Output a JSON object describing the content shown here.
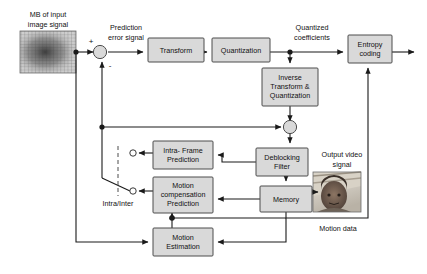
{
  "diagram": {
    "colors": {
      "block_fill": "#d9d9d9",
      "block_stroke": "#4c4c4c",
      "wire": "#1a1a1a",
      "background": "#ffffff"
    },
    "blocks": [
      {
        "id": "transform",
        "label": "Transform",
        "x": 148,
        "y": 38,
        "w": 56,
        "h": 24
      },
      {
        "id": "quantization",
        "label": "Quantization",
        "x": 212,
        "y": 38,
        "w": 58,
        "h": 24
      },
      {
        "id": "entropy_coding",
        "label_line1": "Entropy",
        "label_line2": "coding",
        "x": 348,
        "y": 35,
        "w": 44,
        "h": 28
      },
      {
        "id": "inverse_tq",
        "label_line1": "Inverse",
        "label_line2": "Transform &",
        "label_line3": "Quantization",
        "x": 262,
        "y": 68,
        "w": 56,
        "h": 38
      },
      {
        "id": "deblocking",
        "label_line1": "Deblocking",
        "label_line2": "Filter",
        "x": 256,
        "y": 148,
        "w": 52,
        "h": 28
      },
      {
        "id": "memory",
        "label": "Memory",
        "x": 260,
        "y": 186,
        "w": 52,
        "h": 26
      },
      {
        "id": "intra_frame",
        "label_line1": "Intra- Frame",
        "label_line2": "Prediction",
        "x": 153,
        "y": 141,
        "w": 60,
        "h": 28
      },
      {
        "id": "motion_comp",
        "label_line1": "Motion",
        "label_line2": "compensation",
        "label_line3": "Prediction",
        "x": 153,
        "y": 177,
        "w": 60,
        "h": 36
      },
      {
        "id": "motion_est",
        "label_line1": "Motion",
        "label_line2": "Estimation",
        "x": 153,
        "y": 228,
        "w": 60,
        "h": 28
      }
    ],
    "annotations": [
      {
        "id": "mb_input",
        "line1": "MB of input",
        "line2": "image signal",
        "x": 44,
        "y": 14
      },
      {
        "id": "pred_error",
        "line1": "Prediction",
        "line2": "error signal",
        "x": 124,
        "y": 27
      },
      {
        "id": "quant_coeff",
        "line1": "Quantized",
        "line2": "coefficients",
        "x": 310,
        "y": 27
      },
      {
        "id": "output_video",
        "line1": "Output video",
        "line2": "signal",
        "x": 353,
        "y": 152
      },
      {
        "id": "motion_data",
        "line1": "Motion data",
        "x": 385,
        "y": 229
      },
      {
        "id": "intra_inter",
        "line1": "Intra/Inter",
        "x": 119,
        "y": 203
      }
    ],
    "signs": [
      {
        "id": "plus_sign",
        "label": "+",
        "x": 91,
        "y": 43
      },
      {
        "id": "minus_sign",
        "label": "-",
        "x": 108,
        "y": 65
      }
    ],
    "thumbnails": [
      {
        "id": "input_macroblock_thumbnail",
        "x": 20,
        "y": 31,
        "w": 56,
        "h": 42
      },
      {
        "id": "output_video_thumbnail",
        "x": 313,
        "y": 172,
        "w": 48,
        "h": 40
      }
    ],
    "switch": {
      "id": "intra_inter_switch",
      "label": "Intra/Inter",
      "contact_intra": {
        "x": 133,
        "y": 153
      },
      "contact_inter": {
        "x": 133,
        "y": 191
      },
      "pivot": {
        "x": 102,
        "y": 178
      }
    }
  }
}
